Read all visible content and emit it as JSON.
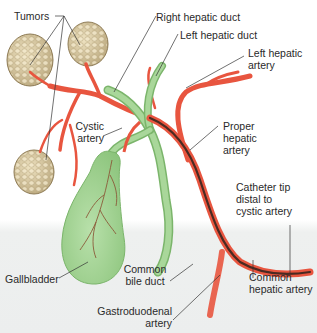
{
  "diagram": {
    "colors": {
      "artery": "#e8553f",
      "artery_light": "#f2826f",
      "duct": "#9fd08f",
      "duct_dark": "#7bb56b",
      "gallbladder": "#a9d79a",
      "tumor": "#d9c9a0",
      "catheter": "#4a2a22",
      "leader_line": "#333333",
      "background_bottom": "#eceeee"
    },
    "labels": {
      "tumors": "Tumors",
      "right_hepatic_duct": "Right hepatic duct",
      "left_hepatic_duct": "Left hepatic duct",
      "left_hepatic_artery": "Left hepatic\nartery",
      "cystic_artery": "Cystic\nartery",
      "proper_hepatic_artery": "Proper\nhepatic\nartery",
      "catheter_tip": "Catheter tip\ndistal to\ncystic artery",
      "gallbladder": "Gallbladder",
      "common_bile_duct": "Common\nbile duct",
      "common_hepatic_artery": "Common\nhepatic artery",
      "gastroduodenal_artery": "Gastroduodenal\nartery"
    }
  }
}
